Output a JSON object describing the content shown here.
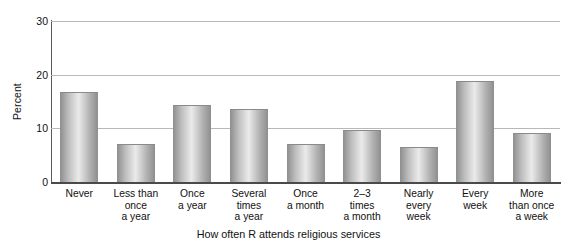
{
  "chart_data": {
    "type": "bar",
    "title": "",
    "xlabel": "How often R attends religious services",
    "ylabel": "Percent",
    "categories": [
      "Never",
      "Less than\nonce\na year",
      "Once\na year",
      "Several\ntimes\na year",
      "Once\na month",
      "2–3\ntimes\na month",
      "Nearly\nevery\nweek",
      "Every\nweek",
      "More\nthan once\na week"
    ],
    "values": [
      16.7,
      7.1,
      14.3,
      13.6,
      7.1,
      9.7,
      6.5,
      18.9,
      9.2
    ],
    "ylim": [
      0,
      30
    ],
    "yticks": [
      0,
      10,
      20,
      30
    ],
    "ytick_labels": [
      "0",
      "10",
      "20",
      "30"
    ],
    "grid": true,
    "legend": false,
    "bar_color": "#c0c0c0",
    "bar_edge_color": "#8a8a8a",
    "axis_color": "#4a4a4a",
    "gridline_color": "#b8b8b8"
  }
}
